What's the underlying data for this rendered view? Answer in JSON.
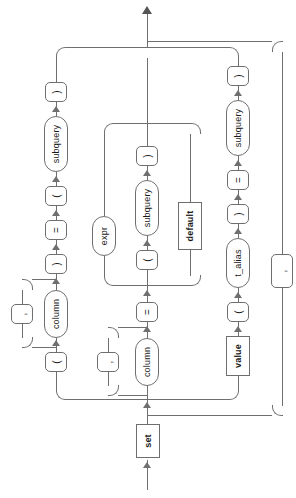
{
  "diagram": {
    "kind": "railroad-syntax-diagram",
    "orientation": "rotated-90-ccw",
    "entry_label": "set",
    "stroke_color": "#6f6f6f",
    "text_color": "#1a1a1a",
    "background": "#ffffff"
  },
  "nodes": {
    "set": "set",
    "value": "value",
    "default": "default",
    "expr": "expr",
    "column_a": "column",
    "column_b": "column",
    "column_c": "column",
    "subquery_a": "subquery",
    "subquery_b": "subquery",
    "subquery_c": "subquery",
    "t_alias": "t_alias",
    "eq_1": "=",
    "eq_2": "=",
    "eq_3": "=",
    "lparen_1": "(",
    "rparen_1": ")",
    "lparen_2": "(",
    "rparen_2": ")",
    "lparen_3": "(",
    "rparen_3": ")",
    "lparen_4": "(",
    "rparen_4": ")",
    "comma_1": ",",
    "comma_2": ","
  },
  "branches": [
    {
      "id": "branch-paren-columns-subquery",
      "sequence": [
        "(",
        "column",
        ")",
        "=",
        "(",
        "subquery",
        ")"
      ],
      "loop": {
        "label": ",",
        "over": "column"
      }
    },
    {
      "id": "branch-column-assign",
      "sequence": [
        "column",
        "=",
        "expr | ( subquery ) | default"
      ],
      "alternatives": [
        "expr",
        "( subquery )",
        "default"
      ]
    },
    {
      "id": "branch-value-alias",
      "sequence": [
        "value",
        "(",
        "t_alias",
        ")",
        "=",
        "(",
        "subquery",
        ")"
      ]
    }
  ],
  "outer_loop": {
    "label": ","
  }
}
